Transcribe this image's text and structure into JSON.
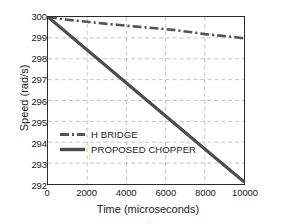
{
  "chart_data": {
    "type": "line",
    "title": "",
    "xlabel": "Time (microseconds)",
    "ylabel": "Speed (rad/s)",
    "xlim": [
      0,
      10000
    ],
    "ylim": [
      292,
      300
    ],
    "xticks": [
      0,
      2000,
      4000,
      6000,
      8000,
      10000
    ],
    "yticks": [
      292,
      293,
      294,
      295,
      296,
      297,
      298,
      299,
      300
    ],
    "grid": true,
    "legend_position": "center-left",
    "series": [
      {
        "name": "H BRIDGE",
        "style": "dash-dot",
        "color": "#555555",
        "x": [
          0,
          500,
          1000,
          1500,
          2000,
          2500,
          3000,
          3500,
          4000,
          4500,
          5000,
          5500,
          6000,
          6500,
          7000,
          7500,
          8000,
          8500,
          9000,
          9500,
          10000
        ],
        "values": [
          300.0,
          299.93,
          299.87,
          299.82,
          299.77,
          299.72,
          299.67,
          299.63,
          299.58,
          299.54,
          299.5,
          299.46,
          299.42,
          299.37,
          299.31,
          299.25,
          299.18,
          299.13,
          299.09,
          299.04,
          298.98
        ]
      },
      {
        "name": "PROPOSED CHOPPER",
        "style": "solid",
        "color": "#4d4d4d",
        "x": [
          0,
          2000,
          4000,
          6000,
          8000,
          10000
        ],
        "values": [
          300.0,
          298.42,
          296.84,
          295.26,
          293.68,
          292.1
        ]
      }
    ]
  },
  "legend": {
    "items": [
      {
        "label": "H BRIDGE"
      },
      {
        "label": "PROPOSED CHOPPER"
      }
    ]
  },
  "style": {
    "grid_color": "#b4b4b4",
    "frame_color": "#2b2b2b",
    "background": "#ffffff"
  }
}
